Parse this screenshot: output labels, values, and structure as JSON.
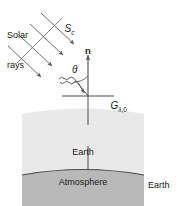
{
  "figure": {
    "type": "schematic-diagram",
    "background_color": "#ffffff",
    "stroke_color": "#555555",
    "atmosphere_fill": "#e8e8e8",
    "surface_fill": "#b8b8b8"
  },
  "labels": {
    "solar_rays": "Solar\nrays",
    "solar_constant": "S",
    "solar_constant_sub": "c",
    "normal_vector": "n",
    "zenith_angle": "θ",
    "irradiance": "G",
    "irradiance_sub_lambda": "λ",
    "irradiance_sub_zero": "0",
    "earth_atmosphere": "Earth\nAtmosphere",
    "earth_surface": "Earth\nsurface"
  },
  "geometry": {
    "ray_count": 4,
    "ray_direction_deg": 52,
    "normal_x": 88,
    "origin_y": 96,
    "atmosphere_left": 22,
    "atmosphere_right": 144,
    "atmosphere_top": 108,
    "atmosphere_bottom": 205,
    "surface_arc_y": 171
  }
}
